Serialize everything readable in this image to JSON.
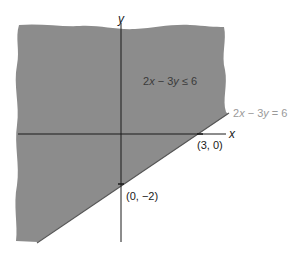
{
  "figure": {
    "colors": {
      "background": "#ffffff",
      "shaded_region": "#8c8c8c",
      "axes": "#1a1a1a",
      "boundary_line": "#555555",
      "boundary_label": "#9a9a9a"
    },
    "axes": {
      "x_label": "x",
      "y_label": "y"
    },
    "region_label": {
      "prefix": "2",
      "var1": "x",
      "op": " − 3",
      "var2": "y",
      "relation": " ≤ 6"
    },
    "boundary_label": {
      "prefix": "2",
      "var1": "x",
      "op": " − 3",
      "var2": "y",
      "relation": " = 6"
    },
    "points": [
      {
        "label": "(3, 0)",
        "x": 3,
        "y": 0
      },
      {
        "label": "(0, −2)",
        "x": 0,
        "y": -2
      }
    ]
  }
}
